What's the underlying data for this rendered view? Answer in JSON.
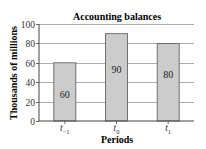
{
  "chart_data": {
    "type": "bar",
    "title": "Accounting balances",
    "xlabel": "Periods",
    "ylabel": "Thousands of millions",
    "categories": [
      "t_-1",
      "t_0",
      "t_1"
    ],
    "category_labels": [
      {
        "base": "t",
        "sub": "−1"
      },
      {
        "base": "t",
        "sub": "0"
      },
      {
        "base": "t",
        "sub": "1"
      }
    ],
    "values": [
      60,
      90,
      80
    ],
    "data_labels": [
      "60",
      "90",
      "80"
    ],
    "ylim": [
      0,
      100
    ],
    "yticks": [
      0,
      20,
      40,
      60,
      80,
      100
    ],
    "grid": true,
    "legend": "none",
    "colors": {
      "bar_fill": "#cccccc",
      "bar_stroke": "#555555",
      "grid": "#999999",
      "axis": "#444444"
    }
  }
}
